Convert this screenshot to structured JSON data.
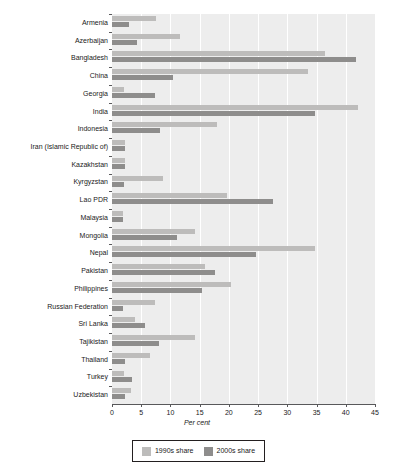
{
  "chart_data": {
    "type": "bar",
    "orientation": "horizontal",
    "title": "",
    "xlabel": "Per cent",
    "ylabel": "",
    "xlim": [
      0,
      45
    ],
    "xticks": [
      0,
      5,
      10,
      15,
      20,
      25,
      30,
      35,
      40,
      45
    ],
    "grid": true,
    "legend_position": "bottom",
    "categories": [
      "Armenia",
      "Azerbaijan",
      "Bangladesh",
      "China",
      "Georgia",
      "India",
      "Indonesia",
      "Iran (Islamic Republic of)",
      "Kazakhstan",
      "Kyrgyzstan",
      "Lao PDR",
      "Malaysia",
      "Mongolia",
      "Nepal",
      "Pakistan",
      "Philippines",
      "Russian Federation",
      "Sri Lanka",
      "Tajikistan",
      "Thailand",
      "Turkey",
      "Uzbekistan"
    ],
    "series": [
      {
        "name": "1990s share",
        "color": "#bdbcbb",
        "values": [
          7.5,
          11.6,
          36.5,
          33.6,
          2.1,
          42.1,
          18.0,
          2.2,
          2.2,
          8.7,
          19.6,
          1.9,
          14.2,
          34.8,
          15.9,
          20.4,
          7.3,
          4.0,
          14.2,
          6.5,
          2.1,
          3.3
        ]
      },
      {
        "name": "2000s share",
        "color": "#8e8d8c",
        "values": [
          2.9,
          4.3,
          41.8,
          10.4,
          7.4,
          34.8,
          8.2,
          2.2,
          2.2,
          2.1,
          27.6,
          1.9,
          11.1,
          24.6,
          17.6,
          15.4,
          1.9,
          5.6,
          8.0,
          2.3,
          3.5,
          2.3
        ]
      }
    ]
  },
  "legend": {
    "entries": [
      {
        "label": "1990s share",
        "color": "#bdbcbb"
      },
      {
        "label": "2000s share",
        "color": "#8e8d8c"
      }
    ]
  },
  "axis": {
    "x_title": "Per cent"
  }
}
